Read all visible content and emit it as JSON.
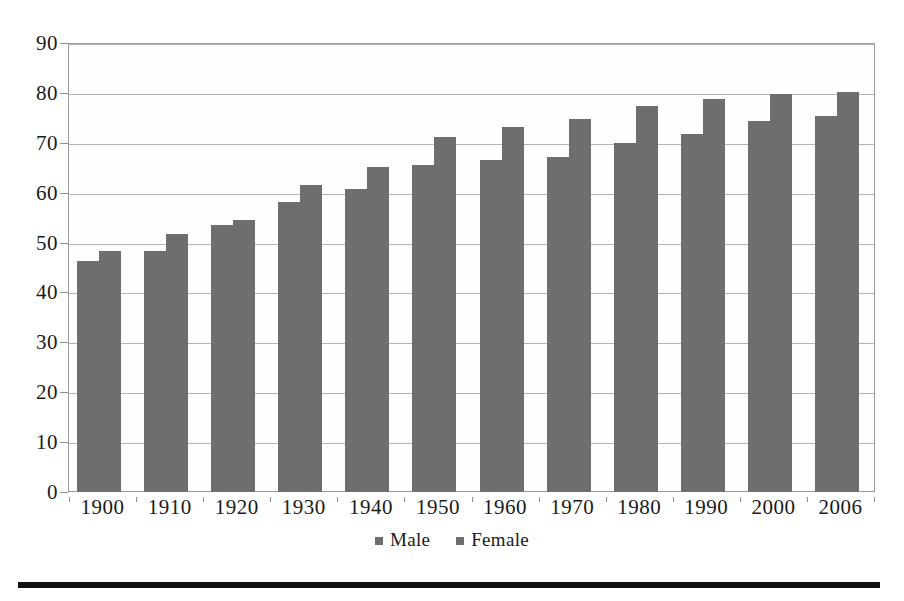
{
  "chart_data": {
    "type": "bar",
    "title": "",
    "xlabel": "",
    "ylabel": "",
    "categories": [
      "1900",
      "1910",
      "1920",
      "1930",
      "1940",
      "1950",
      "1960",
      "1970",
      "1980",
      "1990",
      "2000",
      "2006"
    ],
    "series": [
      {
        "name": "Male",
        "color": "#6e6e6e",
        "values": [
          46.3,
          48.4,
          53.6,
          58.1,
          60.8,
          65.6,
          66.6,
          67.1,
          70.0,
          71.8,
          74.3,
          75.4
        ]
      },
      {
        "name": "Female",
        "color": "#6e6e6e",
        "values": [
          48.3,
          51.8,
          54.6,
          61.6,
          65.2,
          71.1,
          73.1,
          74.7,
          77.4,
          78.8,
          79.7,
          80.2
        ]
      }
    ],
    "ylim": [
      0,
      90
    ],
    "y_ticks": [
      0,
      10,
      20,
      30,
      40,
      50,
      60,
      70,
      80,
      90
    ],
    "y_tick_labels": [
      "0",
      "10",
      "20",
      "30",
      "40",
      "50",
      "60",
      "70",
      "80",
      "90"
    ],
    "grid": true,
    "legend_position": "bottom",
    "legend": [
      "Male",
      "Female"
    ]
  },
  "legend": {
    "entries": [
      {
        "label": "Male"
      },
      {
        "label": "Female"
      }
    ]
  },
  "icons": {
    "male_swatch": "square-marker-icon",
    "female_swatch": "square-marker-icon"
  }
}
